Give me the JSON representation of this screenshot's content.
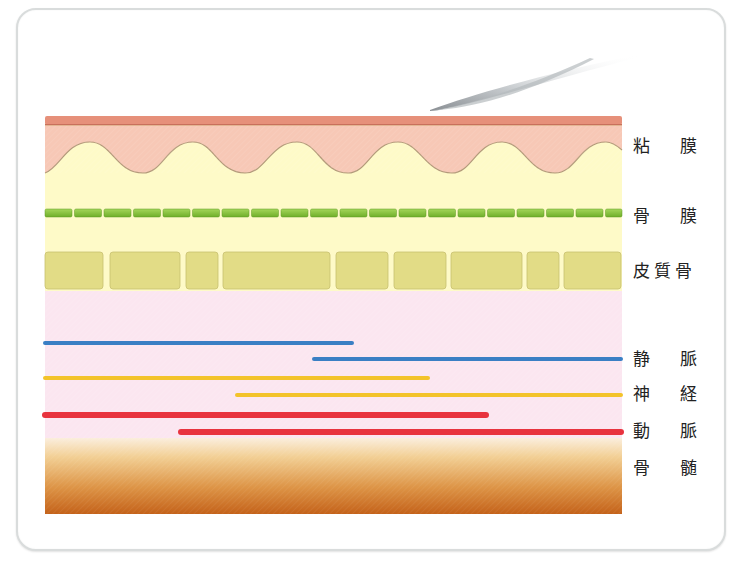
{
  "diagram": {
    "labels": [
      {
        "id": "mucosa",
        "chars": [
          "粘",
          "膜"
        ],
        "text": "粘 膜",
        "y": 136
      },
      {
        "id": "periosteum",
        "chars": [
          "骨",
          "膜"
        ],
        "text": "骨 膜",
        "y": 206
      },
      {
        "id": "cortical-bone",
        "chars": [
          "皮",
          "質",
          "骨"
        ],
        "text": "皮質骨",
        "y": 261
      },
      {
        "id": "vein",
        "chars": [
          "静",
          "脈"
        ],
        "text": "静 脈",
        "y": 349
      },
      {
        "id": "nerve",
        "chars": [
          "神",
          "経"
        ],
        "text": "神 経",
        "y": 384
      },
      {
        "id": "artery",
        "chars": [
          "動",
          "脈"
        ],
        "text": "動 脈",
        "y": 421
      },
      {
        "id": "bone-marrow",
        "chars": [
          "骨",
          "髄"
        ],
        "text": "骨 髄",
        "y": 458
      }
    ],
    "colors": {
      "mucosa_top": "#e6907a",
      "mucosa": "#f6c9b8",
      "submucosa": "#fefac8",
      "periosteum": "#8cc63f",
      "cortical_bone": "#e2dc86",
      "cancellous": "#fbe6f0",
      "vein": "#3a7fc4",
      "nerve": "#f3c32a",
      "artery": "#e8333e",
      "marrow_top": "#f7e2b6",
      "marrow_bottom": "#c96a1c"
    },
    "cortical_blocks": [
      [
        45,
        103
      ],
      [
        110,
        180
      ],
      [
        186,
        218
      ],
      [
        223,
        330
      ],
      [
        336,
        388
      ],
      [
        394,
        446
      ],
      [
        451,
        522
      ],
      [
        527,
        559
      ],
      [
        564,
        621
      ]
    ],
    "vessels": [
      {
        "type": "vein",
        "x1": 45,
        "x2": 352,
        "y": 343
      },
      {
        "type": "vein",
        "x1": 314,
        "x2": 621,
        "y": 359
      },
      {
        "type": "nerve",
        "x1": 45,
        "x2": 428,
        "y": 378
      },
      {
        "type": "nerve",
        "x1": 237,
        "x2": 621,
        "y": 395
      },
      {
        "type": "artery",
        "x1": 45,
        "x2": 486,
        "y": 415
      },
      {
        "type": "artery",
        "x1": 181,
        "x2": 621,
        "y": 432
      }
    ]
  }
}
